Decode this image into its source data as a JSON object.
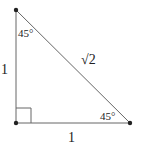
{
  "diagram": {
    "type": "right-triangle",
    "vertices": {
      "top": [
        16,
        10
      ],
      "bottom_left": [
        16,
        123
      ],
      "bottom_right": [
        130,
        123
      ]
    },
    "colors": {
      "line": "#555555",
      "point": "#222222",
      "text": "#222222"
    },
    "labels": {
      "top_angle": "45°",
      "bottom_right_angle": "45°",
      "hypotenuse": "√2",
      "left_side": "1",
      "bottom_side": "1"
    }
  }
}
